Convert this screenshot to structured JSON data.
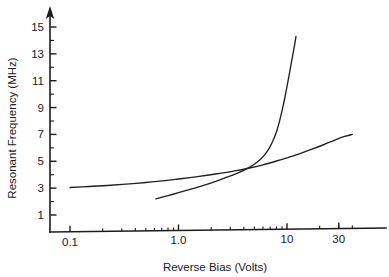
{
  "chart_data": {
    "type": "line",
    "title": "",
    "xlabel": "Reverse Bias (Volts)",
    "ylabel": "Resonant Frequency (MHz)",
    "xscale": "log",
    "yscale": "linear",
    "xlim": [
      0.08,
      45
    ],
    "ylim": [
      0,
      16
    ],
    "grid": false,
    "legend": "none",
    "x_ticks": [
      {
        "value": 0.1,
        "label": "0.1"
      },
      {
        "value": 1.0,
        "label": "1.0"
      },
      {
        "value": 10,
        "label": "10"
      },
      {
        "value": 30,
        "label": "30"
      }
    ],
    "y_ticks": [
      {
        "value": 1,
        "label": "1"
      },
      {
        "value": 2,
        "label": ""
      },
      {
        "value": 3,
        "label": "3"
      },
      {
        "value": 4,
        "label": ""
      },
      {
        "value": 5,
        "label": "5"
      },
      {
        "value": 6,
        "label": ""
      },
      {
        "value": 7,
        "label": "7"
      },
      {
        "value": 8,
        "label": ""
      },
      {
        "value": 9,
        "label": "9"
      },
      {
        "value": 10,
        "label": ""
      },
      {
        "value": 11,
        "label": "11"
      },
      {
        "value": 12,
        "label": ""
      },
      {
        "value": 13,
        "label": "13"
      },
      {
        "value": 14,
        "label": ""
      },
      {
        "value": 15,
        "label": "15"
      }
    ],
    "series": [
      {
        "name": "shallow-curve",
        "color": "#202020",
        "points": [
          [
            0.1,
            3.05
          ],
          [
            0.15,
            3.12
          ],
          [
            0.22,
            3.2
          ],
          [
            0.33,
            3.3
          ],
          [
            0.5,
            3.42
          ],
          [
            0.75,
            3.56
          ],
          [
            1.0,
            3.68
          ],
          [
            1.5,
            3.86
          ],
          [
            2.2,
            4.05
          ],
          [
            3.3,
            4.28
          ],
          [
            4.5,
            4.5
          ],
          [
            6.0,
            4.74
          ],
          [
            8.0,
            5.02
          ],
          [
            10.0,
            5.26
          ],
          [
            13.0,
            5.56
          ],
          [
            17.0,
            5.9
          ],
          [
            22.0,
            6.25
          ],
          [
            28.0,
            6.6
          ],
          [
            34.0,
            6.85
          ],
          [
            40.0,
            7.0
          ]
        ]
      },
      {
        "name": "steep-curve",
        "color": "#202020",
        "points": [
          [
            0.62,
            2.2
          ],
          [
            0.8,
            2.44
          ],
          [
            1.0,
            2.66
          ],
          [
            1.3,
            2.92
          ],
          [
            1.7,
            3.2
          ],
          [
            2.2,
            3.5
          ],
          [
            2.8,
            3.82
          ],
          [
            3.5,
            4.12
          ],
          [
            4.2,
            4.42
          ],
          [
            5.0,
            4.78
          ],
          [
            5.8,
            5.2
          ],
          [
            6.6,
            5.75
          ],
          [
            7.3,
            6.4
          ],
          [
            8.0,
            7.2
          ],
          [
            8.6,
            8.1
          ],
          [
            9.2,
            9.1
          ],
          [
            9.8,
            10.2
          ],
          [
            10.4,
            11.3
          ],
          [
            11.0,
            12.4
          ],
          [
            11.6,
            13.4
          ],
          [
            12.1,
            14.3
          ]
        ]
      }
    ],
    "annotations": [
      {
        "name": "curve-crossing",
        "x": 4.4,
        "y": 4.45,
        "text": ""
      }
    ]
  }
}
